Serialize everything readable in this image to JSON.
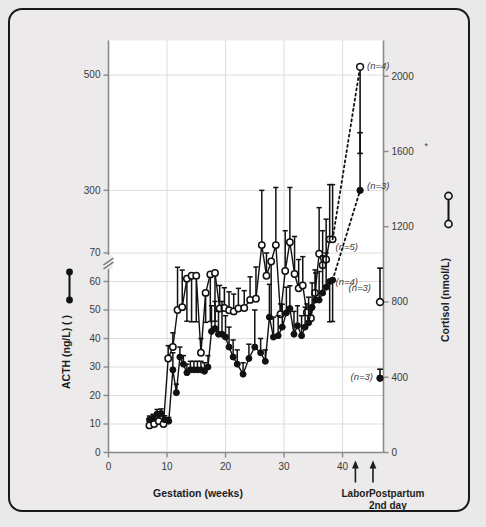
{
  "figure": {
    "background_color": "#eceaea",
    "plot_background_color": "#ffffff",
    "border_color": "#1a1a1a"
  },
  "chart_data": {
    "type": "line",
    "title": "",
    "subtitle": "",
    "xlabel": "Gestation (weeks)",
    "ylabel": "ACTH (ng/L)",
    "y2label": "Cortisol (nmol/L)",
    "xlim": [
      0,
      47
    ],
    "xticks": [
      0,
      10,
      20,
      30,
      40
    ],
    "xticklabels": [
      "0",
      "10",
      "20",
      "30",
      "40"
    ],
    "ylim_lower": [
      0,
      70
    ],
    "ylim_upper": [
      200,
      560
    ],
    "yticks": [
      0,
      10,
      20,
      30,
      40,
      50,
      60,
      70,
      300,
      500
    ],
    "yticklabels": [
      "0",
      "10",
      "20",
      "30",
      "40",
      "50",
      "60",
      "70",
      "300",
      "500"
    ],
    "y_axis_break": true,
    "y_axis_break_note": "axis break between 70 and 300",
    "y2ticks": [
      0,
      400,
      800,
      1200,
      1600,
      2000
    ],
    "y2ticklabels": [
      "0",
      "400",
      "800",
      "1200",
      "1600",
      "2000"
    ],
    "grid": true,
    "grid_color": "#dddddd",
    "legend_position": "axis-labels",
    "series": [
      {
        "name": "ACTH",
        "marker": "filled-circle",
        "color": "#111111",
        "axis": "left",
        "units": "ng/L",
        "x": [
          7.0,
          7.6,
          8.3,
          9.0,
          9.6,
          10.3,
          11.0,
          11.6,
          12.2,
          12.8,
          13.4,
          14.0,
          14.6,
          15.2,
          15.8,
          16.4,
          17.0,
          17.6,
          18.2,
          18.8,
          19.4,
          20.0,
          20.6,
          21.3,
          22.0,
          23.0,
          24.0,
          25.0,
          26.0,
          26.8,
          27.5,
          28.2,
          29.0,
          29.7,
          30.4,
          31.0,
          31.7,
          32.3,
          33.0,
          33.6,
          34.2,
          34.8,
          35.4,
          36.0,
          36.6,
          37.2,
          37.8,
          38.3
        ],
        "y": [
          11.5,
          12.0,
          13.5,
          13.7,
          11.5,
          11.0,
          29.0,
          21.0,
          33.5,
          31.0,
          28.0,
          29.0,
          29.0,
          29.0,
          29.0,
          28.5,
          30.0,
          42.5,
          43.5,
          41.5,
          41.5,
          40.5,
          37.0,
          33.5,
          31.0,
          27.5,
          33.0,
          37.0,
          35.0,
          32.0,
          47.5,
          40.5,
          41.0,
          44.0,
          49.0,
          50.5,
          41.5,
          44.5,
          41.0,
          44.0,
          45.5,
          51.0,
          53.5,
          53.5,
          56.0,
          58.0,
          60.0,
          60.5
        ],
        "yerr_upper": [
          1.3,
          1.4,
          1.6,
          1.6,
          1.4,
          1.3,
          6.0,
          3.0,
          3.5,
          3.0,
          3.0,
          3.0,
          3.0,
          3.0,
          3.0,
          3.0,
          4.0,
          9.0,
          9.5,
          8.0,
          11.5,
          7.5,
          7.0,
          6.0,
          5.0,
          4.0,
          5.0,
          13.0,
          5.0,
          4.0,
          11.5,
          7.0,
          7.0,
          8.0,
          9.0,
          8.0,
          8.0,
          7.0,
          7.0,
          7.0,
          9.0,
          8.5,
          9.5,
          10.0,
          13.0,
          12.0,
          12.0,
          12.0
        ]
      },
      {
        "name": "Cortisol",
        "marker": "open-circle",
        "color": "#111111",
        "axis": "right",
        "units": "nmol/L",
        "x": [
          7.0,
          7.8,
          8.6,
          9.4,
          10.2,
          11.0,
          11.8,
          12.6,
          13.4,
          14.2,
          15.0,
          15.8,
          16.6,
          17.4,
          18.2,
          19.0,
          19.8,
          20.6,
          21.4,
          22.2,
          23.2,
          24.2,
          25.2,
          26.2,
          27.0,
          27.8,
          28.6,
          29.4,
          30.2,
          31.0,
          31.8,
          32.5,
          33.2,
          33.9,
          34.6,
          35.3,
          36.0,
          36.6,
          37.2,
          37.8,
          38.3
        ],
        "y": [
          9.5,
          10.0,
          11.0,
          10.0,
          33.0,
          37.0,
          50.0,
          51.0,
          61.0,
          62.0,
          62.0,
          35.0,
          56.0,
          62.5,
          63.0,
          95.0,
          96.0,
          92.0,
          90.0,
          95.0,
          96.0,
          110.0,
          112.0,
          205.0,
          62.0,
          67.0,
          205.0,
          85.0,
          160.0,
          210.0,
          155.0,
          130.0,
          135.0,
          88.0,
          78.0,
          122.0,
          190.0,
          170.0,
          180.0,
          215.0,
          215.0
        ],
        "yerr_upper": [
          1.2,
          1.3,
          1.5,
          1.3,
          4.5,
          5.0,
          15.0,
          13.0,
          12.0,
          10.0,
          10.0,
          5.0,
          15.0,
          10.0,
          10.0,
          40.0,
          35.0,
          32.0,
          30.0,
          35.0,
          30.0,
          40.0,
          55.0,
          95.0,
          8.0,
          10.0,
          100.0,
          18.0,
          70.0,
          95.0,
          65.0,
          50.0,
          50.0,
          15.0,
          14.0,
          40.0,
          80.0,
          60.0,
          70.0,
          95.0,
          95.0
        ]
      }
    ],
    "post_labor_points": [
      {
        "id": "cortisol-labor",
        "label": "(n=4)",
        "marker": "open-circle",
        "axis": "right",
        "x": 43.0,
        "y_cortisol": 2050,
        "err_low_cortisol": 1590,
        "connector": "dotted"
      },
      {
        "id": "acth-labor",
        "label": "(n=3)",
        "marker": "filled-circle",
        "axis": "left",
        "x": 43.0,
        "y_acth": 300,
        "err_high_acth": 400,
        "connector": "dotted"
      },
      {
        "id": "cortisol-postpartum",
        "label": "(n=3)",
        "marker": "open-circle",
        "axis": "right",
        "x": 46.4,
        "y_cortisol": 800,
        "err_high_cortisol": 980
      },
      {
        "id": "acth-postpartum",
        "label": "(n=3)",
        "marker": "filled-circle",
        "axis": "left",
        "x": 46.4,
        "y_cortisol_scale": 395
      }
    ],
    "in_plot_labels": [
      {
        "id": "n5",
        "text": "(n=5)",
        "series": "Cortisol"
      },
      {
        "id": "n4-acth",
        "text": "(n=4)",
        "series": "ACTH"
      }
    ],
    "annotations": [
      {
        "id": "labor",
        "text": "Labor",
        "x": 42.2,
        "arrow": "up"
      },
      {
        "id": "postpartum",
        "text": "Postpartum",
        "text2": "2nd day",
        "x": 45.2,
        "arrow": "up"
      }
    ],
    "asterisk": "*"
  },
  "axes": {
    "left_label_prefix": "ACTH (ng/L) (",
    "left_label_suffix": ")",
    "right_label": "Cortisol (nmol/L)",
    "x_label": "Gestation (weeks)",
    "left_marker_legend": "filled-circle-pair",
    "right_marker_legend": "open-circle-pair"
  }
}
